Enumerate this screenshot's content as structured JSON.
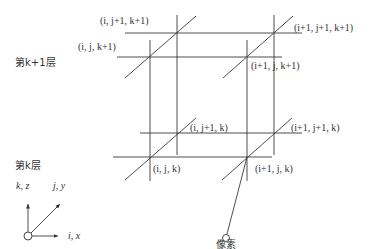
{
  "diagram": {
    "layers": {
      "upper_label": "第k+1层",
      "lower_label": "第k层"
    },
    "nodes": {
      "i_j1_k1": "(i, j+1, k+1)",
      "i_j_k1": "(i, j, k+1)",
      "i1_j1_k1": "(i+1, j+1, k+1)",
      "i1_j_k1": "(i+1, j, k+1)",
      "i_j1_k": "(i, j+1, k)",
      "i1_j1_k": "(i+1, j+1, k)",
      "i_j_k": "(i, j, k)",
      "i1_j_k": "(i+1, j, k)"
    },
    "pixel_label": "像素",
    "axes": {
      "vertical": "k, z",
      "diagonal": "j, y",
      "horizontal": "i, x"
    },
    "line_color": "#3a3a3a"
  }
}
